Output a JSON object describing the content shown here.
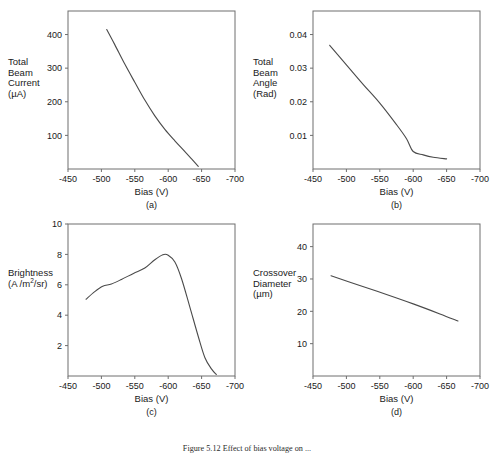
{
  "figure": {
    "caption": "Figure 5.12  Effect of bias voltage on  ..."
  },
  "shared": {
    "xlabel": "Bias  (V)",
    "xticks": [
      "-450",
      "-500",
      "-550",
      "-600",
      "-650",
      "-700"
    ],
    "xlim": [
      -450,
      -700
    ]
  },
  "chart_data": [
    {
      "type": "line",
      "panel": "a",
      "panel_label": "(a)",
      "title": "",
      "xlabel": "Bias  (V)",
      "ylabel": "Total Beam Current (µA)",
      "ylabel_lines": [
        "Total",
        "Beam",
        "Current",
        "(µA)"
      ],
      "xlim": [
        -450,
        -700
      ],
      "ylim": [
        0,
        470
      ],
      "xticks": [
        -450,
        -500,
        -550,
        -600,
        -650,
        -700
      ],
      "yticks": [
        100,
        200,
        300,
        400
      ],
      "ytick_labels": [
        "100",
        "200",
        "300",
        "400"
      ],
      "grid": false,
      "legend": false,
      "x": [
        -508,
        -520,
        -535,
        -550,
        -565,
        -580,
        -595,
        -610,
        -625,
        -635,
        -645
      ],
      "y": [
        415,
        370,
        312,
        258,
        205,
        158,
        118,
        84,
        52,
        30,
        8
      ]
    },
    {
      "type": "line",
      "panel": "b",
      "panel_label": "(b)",
      "title": "",
      "xlabel": "Bias  (V)",
      "ylabel": "Total Beam Angle (Rad)",
      "ylabel_lines": [
        "Total",
        "Beam",
        "Angle",
        "(Rad)"
      ],
      "xlim": [
        -450,
        -700
      ],
      "ylim": [
        0,
        0.047
      ],
      "xticks": [
        -450,
        -500,
        -550,
        -600,
        -650,
        -700
      ],
      "yticks": [
        0.01,
        0.02,
        0.03,
        0.04
      ],
      "ytick_labels": [
        "0.01",
        "0.02",
        "0.03",
        "0.04"
      ],
      "grid": false,
      "legend": false,
      "x": [
        -475,
        -500,
        -525,
        -550,
        -575,
        -590,
        -600,
        -615,
        -630,
        -650
      ],
      "y": [
        0.0368,
        0.031,
        0.0252,
        0.0196,
        0.0132,
        0.009,
        0.0052,
        0.0042,
        0.0035,
        0.003
      ]
    },
    {
      "type": "line",
      "panel": "c",
      "panel_label": "(c)",
      "title": "",
      "xlabel": "Bias  (V)",
      "ylabel": "Brightness (A /m2/sr)",
      "ylabel_lines": [
        "Brightness",
        "(A /m²/sr)"
      ],
      "xlim": [
        -450,
        -700
      ],
      "ylim": [
        0,
        10
      ],
      "xticks": [
        -450,
        -500,
        -550,
        -600,
        -650,
        -700
      ],
      "yticks": [
        2,
        4,
        6,
        8,
        10
      ],
      "ytick_labels": [
        "2",
        "4",
        "6",
        "8",
        "10"
      ],
      "grid": false,
      "legend": false,
      "x": [
        -477,
        -490,
        -502,
        -515,
        -530,
        -548,
        -565,
        -580,
        -592,
        -600,
        -610,
        -620,
        -632,
        -645,
        -655,
        -665,
        -672
      ],
      "y": [
        5.05,
        5.55,
        5.9,
        6.05,
        6.35,
        6.75,
        7.1,
        7.65,
        7.98,
        7.95,
        7.5,
        6.4,
        4.6,
        2.6,
        1.2,
        0.45,
        0.1
      ]
    },
    {
      "type": "line",
      "panel": "d",
      "panel_label": "(d)",
      "title": "",
      "xlabel": "Bias  (V)",
      "ylabel": "Crossover Diameter (µm)",
      "ylabel_lines": [
        "Crossover",
        "Diameter",
        "(µm)"
      ],
      "xlim": [
        -450,
        -700
      ],
      "ylim": [
        0,
        47
      ],
      "xticks": [
        -450,
        -500,
        -550,
        -600,
        -650,
        -700
      ],
      "yticks": [
        10,
        20,
        30,
        40
      ],
      "ytick_labels": [
        "10",
        "20",
        "30",
        "40"
      ],
      "grid": false,
      "legend": false,
      "x": [
        -477,
        -520,
        -560,
        -600,
        -640,
        -667
      ],
      "y": [
        31.0,
        28.0,
        25.2,
        22.3,
        19.2,
        17.0
      ]
    }
  ]
}
